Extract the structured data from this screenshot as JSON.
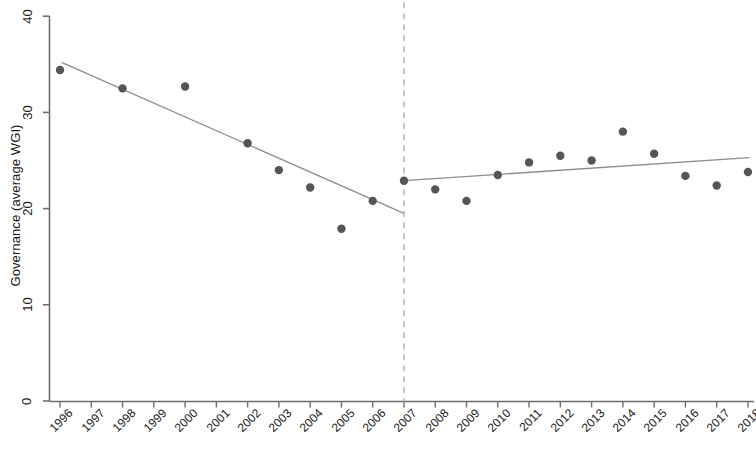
{
  "chart_data": {
    "type": "scatter",
    "title": "",
    "subtitle": "",
    "xlabel": "",
    "ylabel": "Governance (average WGI)",
    "xlim": [
      1995.5,
      2018.5
    ],
    "ylim": [
      0,
      40
    ],
    "yticks": [
      0,
      10,
      20,
      30,
      40
    ],
    "ytick_labels": [
      "0",
      "10",
      "20",
      "30",
      "40"
    ],
    "xticks": [
      1996,
      1997,
      1998,
      1999,
      2000,
      2001,
      2002,
      2003,
      2004,
      2005,
      2006,
      2007,
      2008,
      2009,
      2010,
      2011,
      2012,
      2013,
      2014,
      2015,
      2016,
      2017,
      2018
    ],
    "xtick_labels": [
      "1996",
      "1997",
      "1998",
      "1999",
      "2000",
      "2001",
      "2002",
      "2003",
      "2004",
      "2005",
      "2006",
      "2007",
      "2008",
      "2009",
      "2010",
      "2011",
      "2012",
      "2013",
      "2014",
      "2015",
      "2016",
      "2017",
      "2018"
    ],
    "grid": false,
    "legend": "none",
    "marker_color": "#555555",
    "line_color": "#8c8c8c",
    "axis_color": "#6e6e6e",
    "cutoff_line_color": "#9aa3a8",
    "x": [
      1996,
      1998,
      2000,
      2002,
      2003,
      2004,
      2005,
      2006,
      2007,
      2008,
      2009,
      2010,
      2011,
      2012,
      2013,
      2014,
      2015,
      2016,
      2017,
      2018
    ],
    "y": [
      34.4,
      32.5,
      32.7,
      26.8,
      24.0,
      22.2,
      17.9,
      20.8,
      22.9,
      22.0,
      20.8,
      23.5,
      24.8,
      25.5,
      25.0,
      28.0,
      25.7,
      23.4,
      22.4,
      23.8
    ],
    "points": [
      {
        "year": 1996,
        "value": 34.4
      },
      {
        "year": 1998,
        "value": 32.5
      },
      {
        "year": 2000,
        "value": 32.7
      },
      {
        "year": 2002,
        "value": 26.8
      },
      {
        "year": 2003,
        "value": 24.0
      },
      {
        "year": 2004,
        "value": 22.2
      },
      {
        "year": 2005,
        "value": 17.9
      },
      {
        "year": 2006,
        "value": 20.8
      },
      {
        "year": 2007,
        "value": 22.9
      },
      {
        "year": 2008,
        "value": 22.0
      },
      {
        "year": 2009,
        "value": 20.8
      },
      {
        "year": 2010,
        "value": 23.5
      },
      {
        "year": 2011,
        "value": 24.8
      },
      {
        "year": 2012,
        "value": 25.5
      },
      {
        "year": 2013,
        "value": 25.0
      },
      {
        "year": 2014,
        "value": 28.0
      },
      {
        "year": 2015,
        "value": 25.7
      },
      {
        "year": 2016,
        "value": 23.4
      },
      {
        "year": 2017,
        "value": 22.4
      },
      {
        "year": 2018,
        "value": 23.8
      }
    ],
    "trend_lines": [
      {
        "name": "pre-cutoff-trend",
        "x_start": 1996.05,
        "y_start": 35.2,
        "x_end": 2007.0,
        "y_end": 19.5
      },
      {
        "name": "post-cutoff-trend",
        "x_start": 2007.0,
        "y_start": 22.9,
        "x_end": 2018.05,
        "y_end": 25.3
      }
    ],
    "cutoff": {
      "name": "cutoff-line",
      "x": 2007,
      "style": "dashed",
      "y_start": 0,
      "y_end": 40
    }
  }
}
